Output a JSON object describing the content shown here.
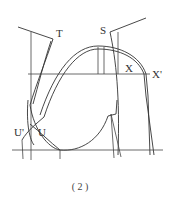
{
  "diagram": {
    "labels": {
      "T": "T",
      "S": "S",
      "X": "X",
      "X_prime": "X'",
      "U": "U",
      "U_prime": "U'"
    },
    "caption": "( 2 )",
    "colors": {
      "line": "#333333",
      "background": "#ffffff"
    }
  }
}
